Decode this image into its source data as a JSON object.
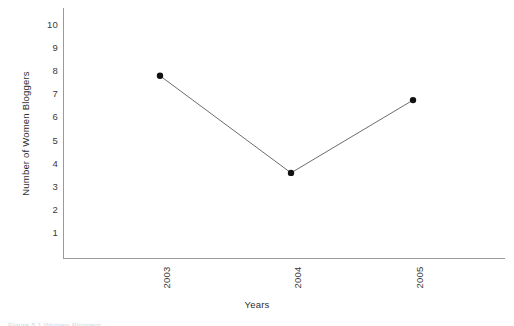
{
  "figure": {
    "background_color": "#ffffff",
    "axis_color": "#9a9a9a",
    "line_color": "#5b5b5b",
    "marker_color": "#111111",
    "caption_clipped": "Figure 5.1  Women Bloggers"
  },
  "chart_data": {
    "type": "line",
    "title": "",
    "subtitle": "",
    "xlabel": "Years",
    "ylabel": "Number of Women Bloggers",
    "categories": [
      "2003",
      "2004",
      "2005"
    ],
    "values": [
      7.8,
      3.6,
      6.75
    ],
    "series": [
      {
        "name": "Number of Women Bloggers",
        "values": [
          7.8,
          3.6,
          6.75
        ]
      }
    ],
    "ylim": [
      0,
      10.4
    ],
    "xlim": [
      0,
      3.4
    ],
    "ytick_labels": [
      "10",
      "9",
      "8",
      "7",
      "6",
      "5",
      "4",
      "3",
      "2",
      "1"
    ],
    "ytick_values": [
      10,
      9,
      8,
      7,
      6,
      5,
      4,
      3,
      2,
      1
    ],
    "xtick_labels": [
      "2003",
      "2004",
      "2005"
    ],
    "grid": false,
    "legend": false,
    "legend_position": "none",
    "marker": "filled-circle",
    "annotations": []
  }
}
